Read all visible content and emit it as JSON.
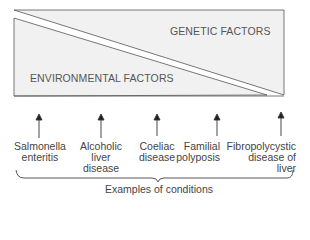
{
  "diagram": {
    "regions": {
      "upper_label": "GENETIC FACTORS",
      "lower_label": "ENVIRONMENTAL FACTORS"
    },
    "conditions": [
      {
        "lines": [
          "Salmonella",
          "enteritis"
        ]
      },
      {
        "lines": [
          "Alcoholic",
          "liver",
          "disease"
        ]
      },
      {
        "lines": [
          "Coeliac",
          "disease"
        ]
      },
      {
        "lines": [
          "Familial",
          "polyposis"
        ]
      },
      {
        "lines": [
          "Fibropolycystic",
          "disease of",
          "liver"
        ]
      }
    ],
    "brace_caption": "Examples of conditions",
    "colors": {
      "box_fill": "#f1f1f1",
      "stroke": "#555555"
    }
  }
}
